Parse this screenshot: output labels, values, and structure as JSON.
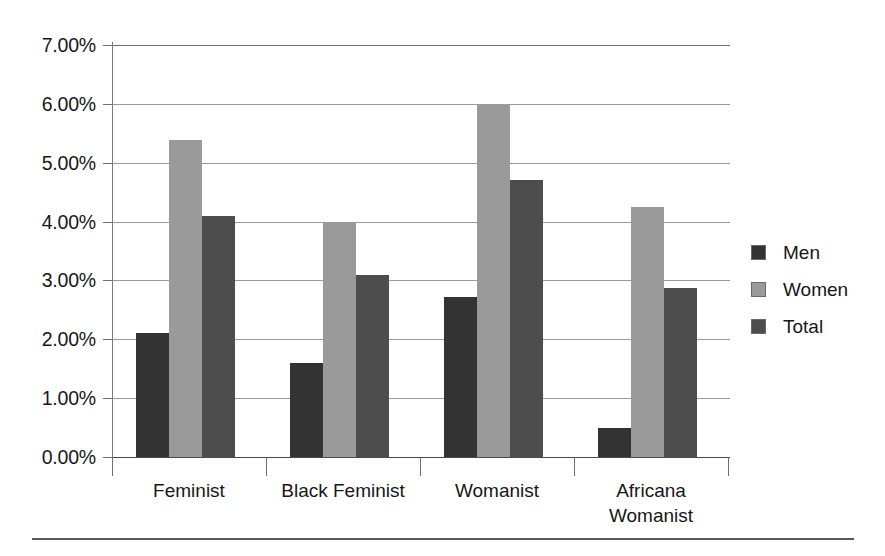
{
  "chart_data": {
    "type": "bar",
    "title": "",
    "subtitle": "",
    "xlabel": "",
    "ylabel": "",
    "categories": [
      "Feminist",
      "Black Feminist",
      "Womanist",
      "Africana\nWomanist"
    ],
    "series": [
      {
        "name": "Men",
        "color": "#333333",
        "values": [
          2.1,
          1.6,
          2.72,
          0.5
        ]
      },
      {
        "name": "Women",
        "color": "#9a9a9a",
        "values": [
          5.38,
          4.0,
          6.0,
          4.25
        ]
      },
      {
        "name": "Total",
        "color": "#4d4d4d",
        "values": [
          4.1,
          3.1,
          4.7,
          2.88
        ]
      }
    ],
    "ylim": [
      0,
      7
    ],
    "ytick_values": [
      0,
      1,
      2,
      3,
      4,
      5,
      6,
      7
    ],
    "ytick_labels": [
      "0.00%",
      "1.00%",
      "2.00%",
      "3.00%",
      "4.00%",
      "5.00%",
      "6.00%",
      "7.00%"
    ],
    "grid": true,
    "grid_axis": "y",
    "legend_position": "right",
    "value_suffix": "%",
    "annotations": []
  },
  "axes": {
    "y": {
      "ticks": [
        {
          "label": "7.00%",
          "value": 7
        },
        {
          "label": "6.00%",
          "value": 6
        },
        {
          "label": "5.00%",
          "value": 5
        },
        {
          "label": "4.00%",
          "value": 4
        },
        {
          "label": "3.00%",
          "value": 3
        },
        {
          "label": "2.00%",
          "value": 2
        },
        {
          "label": "1.00%",
          "value": 1
        },
        {
          "label": "0.00%",
          "value": 0
        }
      ]
    },
    "x": {
      "categories": [
        {
          "label": "Feminist"
        },
        {
          "label": "Black Feminist"
        },
        {
          "label": "Womanist"
        },
        {
          "label": "Africana\nWomanist"
        }
      ]
    }
  },
  "legend": {
    "items": [
      {
        "label": "Men",
        "color": "#333333"
      },
      {
        "label": "Women",
        "color": "#9a9a9a"
      },
      {
        "label": "Total",
        "color": "#4d4d4d"
      }
    ]
  }
}
